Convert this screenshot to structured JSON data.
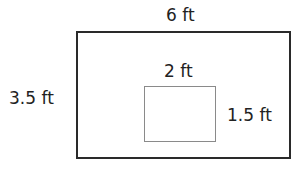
{
  "diagram": {
    "type": "rectangle-with-inner-rectangle",
    "outer_rect": {
      "width_label": "6 ft",
      "height_label": "3.5 ft",
      "border_color": "#2a2a2a"
    },
    "inner_rect": {
      "width_label": "2 ft",
      "height_label": "1.5 ft",
      "border_color": "#8a8a8a"
    }
  }
}
